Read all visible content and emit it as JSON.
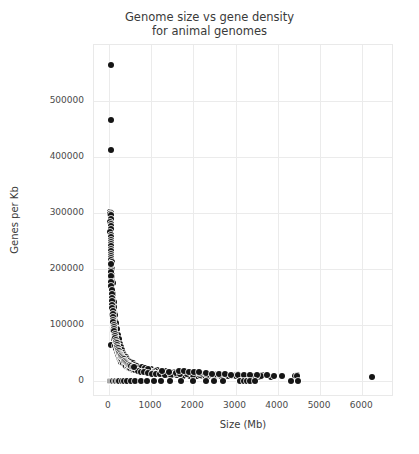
{
  "chart_data": {
    "type": "scatter",
    "title_line1": "Genome size vs gene density",
    "title_line2": "for animal genomes",
    "xlabel": "Size (Mb)",
    "ylabel": "Genes per Kb",
    "xlim": [
      -350,
      6750
    ],
    "ylim": [
      -28000,
      600000
    ],
    "grid": true,
    "legend": null,
    "marker": {
      "shape": "circle",
      "color": "#151515",
      "edge_color": "#ffffff",
      "size_px": 6
    },
    "xticks": [
      0,
      1000,
      2000,
      3000,
      4000,
      5000,
      6000
    ],
    "xtick_labels": [
      "0",
      "1000",
      "2000",
      "3000",
      "4000",
      "5000",
      "6000"
    ],
    "yticks": [
      0,
      100000,
      200000,
      300000,
      400000,
      500000
    ],
    "ytick_labels": [
      "0",
      "100000",
      "200000",
      "300000",
      "400000",
      "500000"
    ],
    "points": [
      [
        55,
        565000
      ],
      [
        52,
        467000
      ],
      [
        40,
        413000
      ],
      [
        38,
        302000
      ],
      [
        44,
        300000
      ],
      [
        36,
        298000
      ],
      [
        48,
        296000
      ],
      [
        41,
        290000
      ],
      [
        39,
        285000
      ],
      [
        50,
        281000
      ],
      [
        45,
        277000
      ],
      [
        43,
        271000
      ],
      [
        37,
        266000
      ],
      [
        52,
        262000
      ],
      [
        47,
        258000
      ],
      [
        42,
        253000
      ],
      [
        55,
        249000
      ],
      [
        46,
        245000
      ],
      [
        40,
        241000
      ],
      [
        58,
        236000
      ],
      [
        49,
        232000
      ],
      [
        44,
        228000
      ],
      [
        62,
        224000
      ],
      [
        53,
        220000
      ],
      [
        47,
        217000
      ],
      [
        66,
        213000
      ],
      [
        57,
        209000
      ],
      [
        51,
        205000
      ],
      [
        70,
        201000
      ],
      [
        60,
        198000
      ],
      [
        54,
        194000
      ],
      [
        75,
        190000
      ],
      [
        64,
        187000
      ],
      [
        58,
        183000
      ],
      [
        80,
        179000
      ],
      [
        68,
        176000
      ],
      [
        61,
        172000
      ],
      [
        86,
        168000
      ],
      [
        73,
        165000
      ],
      [
        65,
        161000
      ],
      [
        92,
        157000
      ],
      [
        78,
        154000
      ],
      [
        69,
        150000
      ],
      [
        99,
        147000
      ],
      [
        84,
        143000
      ],
      [
        74,
        140000
      ],
      [
        107,
        136000
      ],
      [
        90,
        133000
      ],
      [
        79,
        129000
      ],
      [
        116,
        126000
      ],
      [
        97,
        122000
      ],
      [
        85,
        119000
      ],
      [
        126,
        116000
      ],
      [
        105,
        113000
      ],
      [
        91,
        110000
      ],
      [
        137,
        107000
      ],
      [
        114,
        104000
      ],
      [
        98,
        101000
      ],
      [
        150,
        98000
      ],
      [
        124,
        95000
      ],
      [
        106,
        92000
      ],
      [
        165,
        89000
      ],
      [
        136,
        87000
      ],
      [
        115,
        84000
      ],
      [
        182,
        81000
      ],
      [
        149,
        79000
      ],
      [
        125,
        76000
      ],
      [
        201,
        74000
      ],
      [
        164,
        72000
      ],
      [
        137,
        69000
      ],
      [
        60,
        65000
      ],
      [
        223,
        67000
      ],
      [
        181,
        65000
      ],
      [
        151,
        63000
      ],
      [
        248,
        61000
      ],
      [
        201,
        59000
      ],
      [
        167,
        57000
      ],
      [
        277,
        55000
      ],
      [
        224,
        53000
      ],
      [
        186,
        52000
      ],
      [
        310,
        50000
      ],
      [
        251,
        48000
      ],
      [
        208,
        47000
      ],
      [
        348,
        45000
      ],
      [
        282,
        44000
      ],
      [
        233,
        42000
      ],
      [
        392,
        41000
      ],
      [
        318,
        40000
      ],
      [
        262,
        38000
      ],
      [
        443,
        37000
      ],
      [
        360,
        36000
      ],
      [
        296,
        35000
      ],
      [
        502,
        34000
      ],
      [
        409,
        33000
      ],
      [
        336,
        32000
      ],
      [
        571,
        31000
      ],
      [
        466,
        30000
      ],
      [
        383,
        29000
      ],
      [
        651,
        28000
      ],
      [
        532,
        27000
      ],
      [
        438,
        26000
      ],
      [
        745,
        26000
      ],
      [
        610,
        25000
      ],
      [
        502,
        24000
      ],
      [
        857,
        23500
      ],
      [
        700,
        23000
      ],
      [
        577,
        22000
      ],
      [
        988,
        22000
      ],
      [
        808,
        21000
      ],
      [
        665,
        20500
      ],
      [
        1143,
        20000
      ],
      [
        934,
        19500
      ],
      [
        770,
        19000
      ],
      [
        1328,
        18500
      ],
      [
        1086,
        18000
      ],
      [
        895,
        17500
      ],
      [
        1549,
        17000
      ],
      [
        1267,
        16800
      ],
      [
        1045,
        16000
      ],
      [
        1817,
        16000
      ],
      [
        1485,
        15500
      ],
      [
        1226,
        15000
      ],
      [
        2142,
        15000
      ],
      [
        1752,
        14500
      ],
      [
        1446,
        14000
      ],
      [
        2541,
        14000
      ],
      [
        2076,
        13500
      ],
      [
        1715,
        13000
      ],
      [
        3038,
        13000
      ],
      [
        2482,
        12500
      ],
      [
        2051,
        12000
      ],
      [
        3660,
        12000
      ],
      [
        2990,
        11800
      ],
      [
        2471,
        11500
      ],
      [
        4450,
        11000
      ],
      [
        3632,
        10800
      ],
      [
        3003,
        10500
      ],
      [
        140,
        120000
      ],
      [
        155,
        95000
      ],
      [
        175,
        88000
      ],
      [
        190,
        72000
      ],
      [
        205,
        60000
      ],
      [
        220,
        55000
      ],
      [
        240,
        48000
      ],
      [
        265,
        44000
      ],
      [
        290,
        40000
      ],
      [
        315,
        36000
      ],
      [
        345,
        33000
      ],
      [
        375,
        30000
      ],
      [
        410,
        28000
      ],
      [
        445,
        26000
      ],
      [
        485,
        24000
      ],
      [
        530,
        22500
      ],
      [
        575,
        21000
      ],
      [
        625,
        19500
      ],
      [
        680,
        18500
      ],
      [
        740,
        17500
      ],
      [
        800,
        16500
      ],
      [
        870,
        15800
      ],
      [
        940,
        15000
      ],
      [
        1020,
        14200
      ],
      [
        1100,
        13600
      ],
      [
        1190,
        13000
      ],
      [
        1290,
        12500
      ],
      [
        1390,
        12000
      ],
      [
        1500,
        11600
      ],
      [
        1620,
        11200
      ],
      [
        1750,
        10800
      ],
      [
        1880,
        10500
      ],
      [
        2030,
        10200
      ],
      [
        2180,
        9900
      ],
      [
        2350,
        9600
      ],
      [
        2520,
        9400
      ],
      [
        2710,
        9200
      ],
      [
        2900,
        9000
      ],
      [
        3120,
        8800
      ],
      [
        3340,
        8700
      ],
      [
        3580,
        8600
      ],
      [
        3840,
        8500
      ],
      [
        95,
        175000
      ],
      [
        110,
        155000
      ],
      [
        120,
        142000
      ],
      [
        130,
        132000
      ],
      [
        150,
        118000
      ],
      [
        170,
        105000
      ],
      [
        195,
        93000
      ],
      [
        215,
        83000
      ],
      [
        235,
        75000
      ],
      [
        260,
        67000
      ],
      [
        285,
        61000
      ],
      [
        310,
        56000
      ],
      [
        340,
        51000
      ],
      [
        370,
        47000
      ],
      [
        405,
        43000
      ],
      [
        440,
        40000
      ],
      [
        480,
        37000
      ],
      [
        520,
        34500
      ],
      [
        565,
        32000
      ],
      [
        615,
        30000
      ],
      [
        670,
        28000
      ],
      [
        730,
        26500
      ],
      [
        790,
        25000
      ],
      [
        860,
        23500
      ],
      [
        930,
        22500
      ],
      [
        460,
        28000
      ],
      [
        510,
        24000
      ],
      [
        560,
        22000
      ],
      [
        620,
        20000
      ],
      [
        690,
        18500
      ],
      [
        760,
        17000
      ],
      [
        840,
        16000
      ],
      [
        920,
        15000
      ],
      [
        1010,
        14000
      ],
      [
        1110,
        13200
      ],
      [
        1220,
        12500
      ],
      [
        1340,
        11900
      ],
      [
        1470,
        11300
      ],
      [
        1610,
        10900
      ],
      [
        1760,
        10400
      ],
      [
        1920,
        10000
      ],
      [
        2090,
        9700
      ],
      [
        2270,
        9400
      ],
      [
        2460,
        9100
      ],
      [
        2660,
        8900
      ],
      [
        2870,
        8700
      ],
      [
        3090,
        8500
      ],
      [
        3320,
        8400
      ],
      [
        3560,
        8300
      ],
      [
        1250,
        18000
      ],
      [
        1430,
        16500
      ],
      [
        1580,
        15000
      ],
      [
        1690,
        14000
      ],
      [
        1840,
        13000
      ],
      [
        1990,
        12200
      ],
      [
        2150,
        11500
      ],
      [
        2320,
        11000
      ],
      [
        2480,
        10500
      ],
      [
        2650,
        10000
      ],
      [
        2830,
        9700
      ],
      [
        3010,
        9400
      ],
      [
        3200,
        9100
      ],
      [
        3400,
        8900
      ],
      [
        3610,
        8700
      ],
      [
        2150,
        15500
      ],
      [
        2300,
        14500
      ],
      [
        2450,
        13800
      ],
      [
        2600,
        13200
      ],
      [
        2750,
        12600
      ],
      [
        2900,
        12100
      ],
      [
        3050,
        11700
      ],
      [
        3200,
        11300
      ],
      [
        3350,
        11000
      ],
      [
        3500,
        10700
      ],
      [
        1650,
        19000
      ],
      [
        1780,
        18000
      ],
      [
        1900,
        17200
      ],
      [
        2020,
        16500
      ],
      [
        2140,
        15900
      ],
      [
        4100,
        10000
      ],
      [
        4400,
        9500
      ],
      [
        4450,
        9000
      ],
      [
        6220,
        8500
      ],
      [
        3900,
        10200
      ],
      [
        3750,
        10500
      ],
      [
        30,
        1500
      ],
      [
        60,
        1200
      ],
      [
        85,
        1000
      ],
      [
        110,
        1300
      ],
      [
        140,
        900
      ],
      [
        175,
        1100
      ],
      [
        210,
        800
      ],
      [
        250,
        1000
      ],
      [
        300,
        700
      ],
      [
        360,
        900
      ],
      [
        430,
        1100
      ],
      [
        520,
        600
      ],
      [
        620,
        800
      ],
      [
        760,
        1000
      ],
      [
        900,
        700
      ],
      [
        1060,
        900
      ],
      [
        1240,
        600
      ],
      [
        1450,
        800
      ],
      [
        1700,
        1000
      ],
      [
        1980,
        700
      ],
      [
        2300,
        900
      ],
      [
        2480,
        600
      ],
      [
        2700,
        800
      ],
      [
        3100,
        1000
      ],
      [
        3200,
        700
      ],
      [
        3280,
        900
      ],
      [
        3350,
        600
      ],
      [
        3450,
        1100
      ],
      [
        4300,
        800
      ],
      [
        4480,
        900
      ],
      [
        45,
        209000
      ],
      [
        48,
        195000
      ],
      [
        52,
        188000
      ],
      [
        56,
        178000
      ],
      [
        60,
        170000
      ],
      [
        64,
        163000
      ],
      [
        68,
        156000
      ],
      [
        72,
        149000
      ],
      [
        76,
        143000
      ],
      [
        80,
        137000
      ],
      [
        84,
        131000
      ],
      [
        88,
        126000
      ],
      [
        93,
        120000
      ],
      [
        98,
        115000
      ],
      [
        103,
        110000
      ],
      [
        108,
        106000
      ],
      [
        114,
        101000
      ],
      [
        120,
        97000
      ],
      [
        126,
        93000
      ],
      [
        133,
        89000
      ],
      [
        140,
        85000
      ],
      [
        148,
        81000
      ],
      [
        156,
        78000
      ],
      [
        164,
        74000
      ],
      [
        173,
        71000
      ],
      [
        182,
        68000
      ],
      [
        192,
        65000
      ],
      [
        203,
        62000
      ],
      [
        214,
        59000
      ],
      [
        226,
        56000
      ],
      [
        238,
        54000
      ],
      [
        251,
        51000
      ],
      [
        265,
        49000
      ],
      [
        280,
        47000
      ],
      [
        295,
        45000
      ],
      [
        312,
        43000
      ],
      [
        329,
        41000
      ],
      [
        347,
        39000
      ],
      [
        366,
        37000
      ],
      [
        387,
        36000
      ],
      [
        408,
        34000
      ],
      [
        431,
        33000
      ],
      [
        455,
        31000
      ],
      [
        480,
        30000
      ],
      [
        507,
        29000
      ],
      [
        535,
        27500
      ],
      [
        565,
        26500
      ],
      [
        596,
        25500
      ]
    ]
  }
}
